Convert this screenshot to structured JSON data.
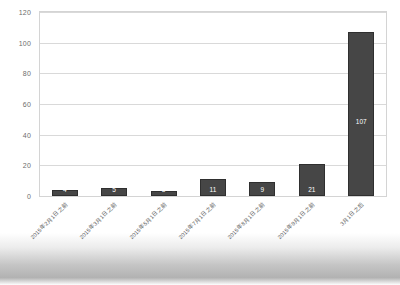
{
  "chart_data": {
    "type": "bar",
    "title": "",
    "xlabel": "",
    "ylabel": "",
    "ylim": [
      0,
      120
    ],
    "ytick_step": 20,
    "yticks": [
      "0",
      "20",
      "40",
      "60",
      "80",
      "100",
      "120"
    ],
    "grid": true,
    "legend": false,
    "bar_color": "#464646",
    "label_color": "#ffffff",
    "categories": [
      "2015年2月1日之前",
      "2015年3月1日之前",
      "2015年5月1日之前",
      "2015年7月1日之前",
      "2015年8月1日之前",
      "2015年9月1日之前",
      "3月1日之后"
    ],
    "values": [
      4,
      5,
      3,
      11,
      9,
      21,
      107
    ],
    "data_labels": [
      "4",
      "5",
      "3",
      "11",
      "9",
      "21",
      "107"
    ]
  }
}
